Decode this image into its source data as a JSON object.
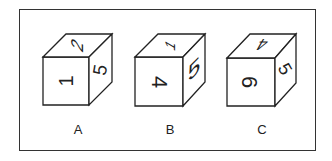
{
  "figure": {
    "cubes": [
      {
        "label": "A",
        "faces": {
          "front": "1",
          "top": "2",
          "right": "5"
        }
      },
      {
        "label": "B",
        "faces": {
          "front": "4",
          "top": "1",
          "right": "5"
        }
      },
      {
        "label": "C",
        "faces": {
          "front": "6",
          "top": "4",
          "right": "5"
        }
      }
    ]
  },
  "colors": {
    "stroke": "#222222",
    "background": "#ffffff"
  }
}
